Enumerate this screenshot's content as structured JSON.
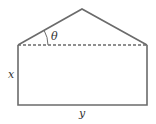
{
  "diagram": {
    "title": "",
    "labels": {
      "height": "x",
      "width": "y",
      "angle": "θ"
    },
    "colors": {
      "stroke": "#6b6b6b",
      "text": "#333333",
      "background": "#ffffff"
    },
    "shapes": [
      {
        "name": "rectangle",
        "sides": [
          "x",
          "y"
        ]
      },
      {
        "name": "isosceles-triangle",
        "base": "y",
        "base_angle": "θ",
        "base_style": "dashed"
      }
    ]
  }
}
